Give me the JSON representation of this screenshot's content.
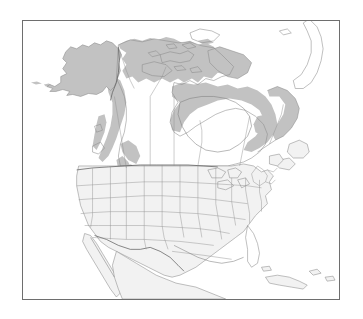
{
  "figure": {
    "kind": "species-range-map",
    "region": "North America",
    "title": "",
    "caption": "",
    "background_color": "#ffffff",
    "frame": {
      "visible": true,
      "color": "#6e6e6e",
      "x": 22,
      "y": 20,
      "width": 318,
      "height": 280
    }
  },
  "legend": {
    "visible": false,
    "entries": [
      {
        "label": "Range",
        "color": "#c2c2c2"
      },
      {
        "label": "Land",
        "color": "#f2f2f2"
      }
    ]
  },
  "colors": {
    "land_fill": "#f2f2f2",
    "land_stroke": "#8a8a8a",
    "range_fill": "#c2c2c2",
    "internal_border": "#8f8f8f",
    "national_border": "#555555",
    "frame": "#6e6e6e",
    "ocean": "#ffffff"
  },
  "map_data": {
    "type": "choropleth-range",
    "projection": "conic",
    "features": [
      {
        "name": "alaska",
        "label": "Alaska",
        "shaded": true
      },
      {
        "name": "yukon-nwt",
        "label": "Yukon / Northwest Territories",
        "shaded": true
      },
      {
        "name": "arctic-archipelago",
        "label": "Canadian Arctic Archipelago",
        "shaded": true
      },
      {
        "name": "hudson-bay-belt",
        "label": "Hudson Bay boreal belt",
        "shaded": true
      },
      {
        "name": "labrador-quebec",
        "label": "Labrador / Quebec",
        "shaded": true
      },
      {
        "name": "british-columbia",
        "label": "British Columbia",
        "shaded": true
      },
      {
        "name": "rocky-mountains",
        "label": "Rocky Mountains corridor",
        "shaded": true
      },
      {
        "name": "great-basin-dots",
        "label": "Great Basin disjunct populations",
        "shaded": true
      },
      {
        "name": "eastern-united-states",
        "label": "Eastern United States",
        "shaded": false
      },
      {
        "name": "newfoundland",
        "label": "Newfoundland",
        "shaded": false
      },
      {
        "name": "mexico",
        "label": "Mexico",
        "shaded": false
      },
      {
        "name": "greenland",
        "label": "Greenland",
        "shaded": false
      },
      {
        "name": "cuba-bahamas",
        "label": "Cuba and Bahamas",
        "shaded": false
      }
    ]
  }
}
